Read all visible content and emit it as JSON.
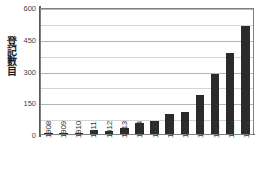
{
  "chart_data": {
    "type": "bar",
    "title": "",
    "subtitle": "",
    "xlabel": "",
    "ylabel": "登記數目",
    "categories": [
      "1908",
      "1909",
      "1910",
      "1911",
      "1912",
      "1913",
      "1914",
      "1915",
      "1916",
      "1917",
      "1918",
      "1919",
      "1920",
      "1921"
    ],
    "values": [
      2,
      3,
      5,
      17,
      16,
      30,
      54,
      60,
      94,
      105,
      185,
      283,
      385,
      510
    ],
    "series": [
      {
        "name": "登記數目",
        "values": [
          2,
          3,
          5,
          17,
          16,
          30,
          54,
          60,
          94,
          105,
          185,
          283,
          385,
          510
        ]
      }
    ],
    "ylim": [
      0,
      600
    ],
    "yticks": [
      0,
      150,
      300,
      450,
      600
    ],
    "ytick_labels": [
      "0",
      "150",
      "300",
      "450",
      "600"
    ],
    "minor_gridline_step": 75,
    "minor_gridlines": [
      75,
      225,
      375,
      525
    ],
    "grid": true,
    "legend": false,
    "legend_position": "none",
    "bar_color": "#2b2b2b",
    "gridline_color": "#b5b5b5",
    "minor_gridline_color": "#d4d4d4",
    "axis_color": "#595959",
    "plot_border_color": "#808080",
    "background_color": "#ffffff",
    "annotations": []
  }
}
